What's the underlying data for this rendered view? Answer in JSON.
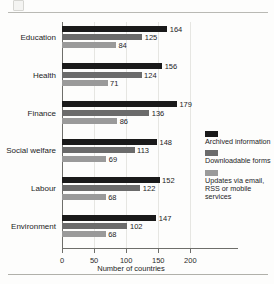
{
  "chart_data": {
    "type": "bar",
    "orientation": "horizontal",
    "title": "",
    "xlabel": "Number of countries",
    "ylabel": "",
    "xlim": [
      0,
      215
    ],
    "xticks": [
      0,
      50,
      100,
      150,
      200
    ],
    "xticklabels": [
      "0",
      "50",
      "100",
      "150",
      "200"
    ],
    "grid": "vertical",
    "legend_position": "right",
    "categories": [
      "Education",
      "Health",
      "Finance",
      "Social welfare",
      "Labour",
      "Environment"
    ],
    "series": [
      {
        "name": "Archived information",
        "color": "#1a1a1a",
        "values": [
          164,
          156,
          179,
          148,
          152,
          147
        ]
      },
      {
        "name": "Downloadable forms",
        "color": "#6b6b6b",
        "values": [
          125,
          124,
          136,
          113,
          122,
          102
        ]
      },
      {
        "name": "Updates via email, RSS or mobile services",
        "color": "#9a9a9a",
        "values": [
          84,
          71,
          86,
          69,
          68,
          68
        ]
      }
    ],
    "legend_entries": [
      {
        "label": "Archived information",
        "color": "#1a1a1a"
      },
      {
        "label": "Downloadable forms",
        "color": "#6b6b6b"
      },
      {
        "label": "Updates via email, RSS or mobile services",
        "color": "#9a9a9a"
      }
    ]
  },
  "colors": {
    "series_dark": "#1a1a1a",
    "series_mid": "#6b6b6b",
    "series_light": "#9a9a9a",
    "axis": "#6e6e6a",
    "grid": "#e6e6e2",
    "rule": "#b9b9b4",
    "background": "#fdfdfc"
  }
}
